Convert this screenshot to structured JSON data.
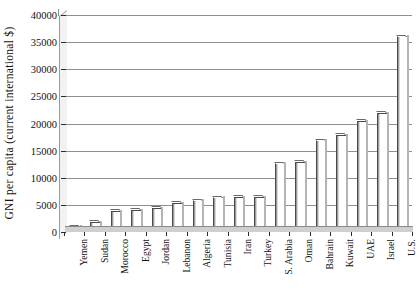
{
  "chart_data": {
    "type": "bar",
    "title": "",
    "xlabel": "",
    "ylabel": "GNI per capita  (current  international  $)",
    "ylim": [
      0,
      40000
    ],
    "ytick_step": 5000,
    "yticks": [
      "0",
      "5000",
      "10000",
      "15000",
      "20000",
      "25000",
      "30000",
      "35000",
      "40000"
    ],
    "grid": true,
    "legend": "none",
    "bar_style": {
      "fill": "#ffffff",
      "edge": "#4a4a4a",
      "shadow": "#b4b4b4"
    },
    "categories": [
      "Yemen",
      "Sudan",
      "Morocco",
      "Egypt",
      "Jordan",
      "Lebanon",
      "Algeria",
      "Tunisia",
      "Iran",
      "Turkey",
      "S. Arabia",
      "Oman",
      "Bahrain",
      "Kuwait",
      "UAE",
      "Israel",
      "U.S."
    ],
    "values": [
      900,
      1700,
      3700,
      3900,
      4300,
      5200,
      5700,
      6200,
      6300,
      6300,
      12500,
      12800,
      16700,
      17700,
      20300,
      21800,
      35900
    ]
  },
  "axis": {
    "y_title": "GNI per capita  (current  international  $)"
  }
}
